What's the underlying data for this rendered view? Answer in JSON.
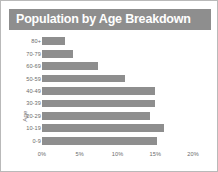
{
  "chart_data": {
    "type": "bar",
    "orientation": "horizontal",
    "title": "Population by Age Breakdown",
    "xlabel": "",
    "ylabel": "Age",
    "categories": [
      "0-9",
      "10-19",
      "20-29",
      "30-39",
      "40-49",
      "50-59",
      "60-69",
      "70-79",
      "80+"
    ],
    "categories_top_to_bottom": [
      "80+",
      "70-79",
      "60-69",
      "50-59",
      "40-49",
      "30-39",
      "20-29",
      "10-19",
      "0-9"
    ],
    "values": [
      15.2,
      16.1,
      14.3,
      15.0,
      15.0,
      11.0,
      7.4,
      4.1,
      3.1
    ],
    "values_top_to_bottom": [
      3.1,
      4.1,
      7.4,
      11.0,
      15.0,
      15.0,
      14.3,
      16.1,
      15.2
    ],
    "value_unit": "%",
    "xlim": [
      0,
      20
    ],
    "x_tick_labels": [
      "0%",
      "5%",
      "10%",
      "15%",
      "20%"
    ],
    "x_tick_values": [
      0,
      5,
      10,
      15,
      20
    ],
    "grid": false,
    "legend": null,
    "bar_color": "#8e8e8e",
    "title_banner_color": "#8e8e8e",
    "title_text_color": "#ffffff",
    "axis_text_color": "#6b6b6b",
    "border_color": "#b9b9b9",
    "background": "#ffffff"
  }
}
